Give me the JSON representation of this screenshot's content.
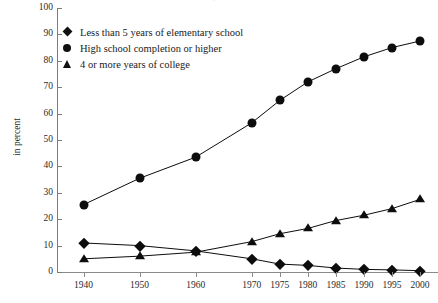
{
  "figure": {
    "title": "Educational attainment, 1940-2000: United States",
    "axis_title_y": "in percent"
  },
  "legend": {
    "position": "top-left-inside",
    "items": [
      {
        "marker": "diamond-marker",
        "label": "Less than 5 years of elementary school"
      },
      {
        "marker": "circle-marker",
        "label": "High school completion or higher"
      },
      {
        "marker": "triangle-marker",
        "label": "4 or more years of college"
      }
    ]
  },
  "chart_data": {
    "type": "line",
    "title": "Educational attainment, 1940-2000: United States",
    "xlabel": "",
    "ylabel": "in percent",
    "ylim": [
      0,
      100
    ],
    "ytick_step": 10,
    "yticks": [
      0,
      10,
      20,
      30,
      40,
      50,
      60,
      70,
      80,
      90,
      100
    ],
    "grid": false,
    "categories": [
      "1940",
      "1950",
      "1960",
      "1970",
      "1975",
      "1980",
      "1985",
      "1990",
      "1995",
      "2000"
    ],
    "series": [
      {
        "name": "Less than 5 years of elementary school",
        "marker": "diamond",
        "color": "#0d0d0d",
        "values": [
          11,
          10,
          8,
          5,
          3,
          2.5,
          1.5,
          1,
          0.8,
          0.5
        ]
      },
      {
        "name": "High school completion or higher",
        "marker": "circle",
        "color": "#0d0d0d",
        "values": [
          25.5,
          35.5,
          43.5,
          56.5,
          65,
          72,
          77,
          81.5,
          85,
          87.5
        ]
      },
      {
        "name": "4 or more years of college",
        "marker": "triangle",
        "color": "#0d0d0d",
        "values": [
          5,
          6,
          7.5,
          11.5,
          14.5,
          16.5,
          19.5,
          21.5,
          24,
          27.5
        ]
      }
    ]
  },
  "colors": {
    "ink": "#0d0d0d",
    "axis": "#7d7d80",
    "text": "#2b2b2b",
    "background": "#ffffff"
  }
}
